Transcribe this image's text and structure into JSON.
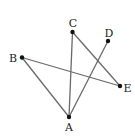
{
  "diagram": {
    "type": "geometry-figure",
    "line_color": "#6a6a6a",
    "point_color": "#111111",
    "label_color": "#222222",
    "points": [
      {
        "id": "A",
        "label": "A",
        "x": 69,
        "y": 117,
        "lx": 69,
        "ly": 131,
        "anchor": "middle"
      },
      {
        "id": "B",
        "label": "B",
        "x": 22,
        "y": 57.5,
        "lx": 13,
        "ly": 62,
        "anchor": "middle"
      },
      {
        "id": "C",
        "label": "C",
        "x": 72.5,
        "y": 32,
        "lx": 73,
        "ly": 27,
        "anchor": "middle"
      },
      {
        "id": "D",
        "label": "D",
        "x": 108,
        "y": 41,
        "lx": 109,
        "ly": 37,
        "anchor": "middle"
      },
      {
        "id": "E",
        "label": "E",
        "x": 120,
        "y": 86,
        "lx": 127.5,
        "ly": 91.5,
        "anchor": "middle"
      }
    ],
    "segments": [
      {
        "from": "B",
        "to": "A"
      },
      {
        "from": "B",
        "to": "E"
      },
      {
        "from": "C",
        "to": "A"
      },
      {
        "from": "C",
        "to": "E"
      },
      {
        "from": "D",
        "to": "A"
      }
    ]
  }
}
